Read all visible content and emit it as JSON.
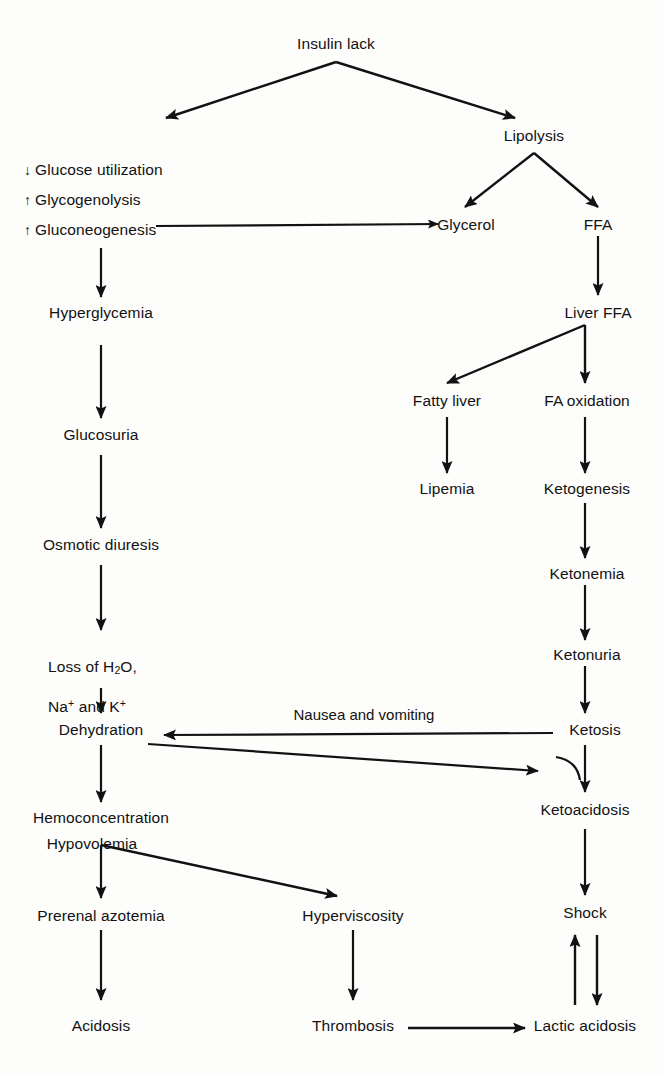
{
  "diagram": {
    "type": "flowchart",
    "background_color": "#fdfdfc",
    "ink_color": "#121212",
    "nodes": {
      "insulin_lack": "Insulin lack",
      "lipolysis": "Lipolysis",
      "glucose_utilization": "Glucose utilization",
      "glucose_utilization_marker": "↓",
      "glycogenolysis": "Glycogenolysis",
      "glycogenolysis_marker": "↑",
      "gluconeogenesis": "Gluconeogenesis",
      "gluconeogenesis_marker": "↑",
      "glycerol": "Glycerol",
      "ffa": "FFA",
      "liver_ffa": "Liver FFA",
      "hyperglycemia": "Hyperglycemia",
      "fatty_liver": "Fatty liver",
      "fa_oxidation": "FA oxidation",
      "glucosuria": "Glucosuria",
      "lipemia": "Lipemia",
      "ketogenesis": "Ketogenesis",
      "osmotic_diuresis": "Osmotic diuresis",
      "ketonemia": "Ketonemia",
      "ketonuria": "Ketonuria",
      "loss_line1": "Loss of H",
      "loss_line1_sub": "2",
      "loss_line1_tail": "O,",
      "loss_line2_a": "Na",
      "loss_line2_sup1": "+",
      "loss_line2_b": " and K",
      "loss_line2_sup2": "+",
      "dehydration": "Dehydration",
      "ketosis": "Ketosis",
      "hemoconcentration": "Hemoconcentration",
      "hypovolemia": "Hypovolemia",
      "ketoacidosis": "Ketoacidosis",
      "prerenal_azotemia": "Prerenal azotemia",
      "hyperviscosity": "Hyperviscosity",
      "shock": "Shock",
      "acidosis": "Acidosis",
      "thrombosis": "Thrombosis",
      "lactic_acidosis": "Lactic acidosis"
    },
    "edge_labels": {
      "nausea_vomiting": "Nausea and vomiting"
    },
    "edges": [
      {
        "from": "insulin_lack",
        "to": "glucose_utilization_group",
        "style": "diagonal-left"
      },
      {
        "from": "insulin_lack",
        "to": "lipolysis",
        "style": "diagonal-right"
      },
      {
        "from": "lipolysis",
        "to": "glycerol",
        "style": "diagonal-left"
      },
      {
        "from": "lipolysis",
        "to": "ffa",
        "style": "diagonal-right"
      },
      {
        "from": "gluconeogenesis",
        "to": "glycerol",
        "style": "horizontal"
      },
      {
        "from": "gluconeogenesis_group",
        "to": "hyperglycemia",
        "style": "vertical"
      },
      {
        "from": "ffa",
        "to": "liver_ffa",
        "style": "vertical"
      },
      {
        "from": "hyperglycemia",
        "to": "glucosuria",
        "style": "vertical"
      },
      {
        "from": "liver_ffa",
        "to": "fatty_liver",
        "style": "diagonal-left"
      },
      {
        "from": "liver_ffa",
        "to": "fa_oxidation",
        "style": "vertical"
      },
      {
        "from": "fatty_liver",
        "to": "lipemia",
        "style": "vertical"
      },
      {
        "from": "fa_oxidation",
        "to": "ketogenesis",
        "style": "vertical"
      },
      {
        "from": "glucosuria",
        "to": "osmotic_diuresis",
        "style": "vertical"
      },
      {
        "from": "ketogenesis",
        "to": "ketonemia",
        "style": "vertical"
      },
      {
        "from": "osmotic_diuresis",
        "to": "loss_of_water",
        "style": "vertical"
      },
      {
        "from": "ketonemia",
        "to": "ketonuria",
        "style": "vertical"
      },
      {
        "from": "loss_of_water",
        "to": "dehydration",
        "style": "vertical"
      },
      {
        "from": "ketonuria",
        "to": "ketosis",
        "style": "vertical"
      },
      {
        "from": "ketosis",
        "to": "dehydration",
        "style": "horizontal-left",
        "label": "Nausea and vomiting"
      },
      {
        "from": "dehydration",
        "to": "ketoacidosis",
        "style": "horizontal-right-curve"
      },
      {
        "from": "dehydration",
        "to": "hemoconcentration",
        "style": "vertical"
      },
      {
        "from": "ketosis",
        "to": "ketoacidosis",
        "style": "vertical"
      },
      {
        "from": "hypovolemia",
        "to": "prerenal_azotemia",
        "style": "vertical"
      },
      {
        "from": "hypovolemia",
        "to": "hyperviscosity",
        "style": "diagonal-right"
      },
      {
        "from": "ketoacidosis",
        "to": "shock",
        "style": "vertical"
      },
      {
        "from": "prerenal_azotemia",
        "to": "acidosis",
        "style": "vertical"
      },
      {
        "from": "hyperviscosity",
        "to": "thrombosis",
        "style": "vertical"
      },
      {
        "from": "shock",
        "to": "lactic_acidosis",
        "style": "vertical-down"
      },
      {
        "from": "lactic_acidosis",
        "to": "shock",
        "style": "vertical-up"
      },
      {
        "from": "thrombosis",
        "to": "lactic_acidosis",
        "style": "horizontal"
      }
    ]
  }
}
